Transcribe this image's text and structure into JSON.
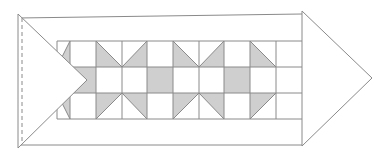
{
  "diagram": {
    "colors": {
      "background": "#ffffff",
      "line": "#8a8a8a",
      "shade": "#cfcfcf"
    },
    "outer_band": {
      "left_top": [
        18,
        18
      ],
      "right_top": [
        302,
        14
      ],
      "left_bottom": [
        18,
        145
      ],
      "right_bottom": [
        302,
        145
      ]
    },
    "inner_band": {
      "x0": 57,
      "x1": 302,
      "top": 41,
      "bottom": 119,
      "top_right": 40,
      "bottom_right": 118
    },
    "grid": {
      "columns_x": [
        57,
        70,
        96,
        122,
        147,
        173,
        199,
        224,
        250,
        276
      ],
      "rows_y": [
        41,
        67,
        93,
        119
      ]
    },
    "left_triangle": {
      "points": [
        [
          18,
          14
        ],
        [
          18,
          148
        ],
        [
          87,
          80
        ]
      ],
      "dashed_line_x": 22
    },
    "right_arrow": {
      "points": [
        [
          302,
          11
        ],
        [
          302,
          146
        ],
        [
          372,
          78
        ]
      ]
    },
    "shaded_cells": [
      {
        "col": 0,
        "row": 0,
        "type": "lower-right"
      },
      {
        "col": 0,
        "row": 2,
        "type": "upper-right"
      },
      {
        "col": 1,
        "row": 1,
        "type": "full"
      },
      {
        "col": 2,
        "row": 0,
        "type": "lower-left"
      },
      {
        "col": 2,
        "row": 2,
        "type": "upper-left"
      },
      {
        "col": 3,
        "row": 0,
        "type": "lower-right"
      },
      {
        "col": 3,
        "row": 2,
        "type": "upper-right"
      },
      {
        "col": 4,
        "row": 1,
        "type": "full"
      },
      {
        "col": 5,
        "row": 0,
        "type": "lower-left"
      },
      {
        "col": 5,
        "row": 2,
        "type": "upper-left"
      },
      {
        "col": 6,
        "row": 0,
        "type": "lower-right"
      },
      {
        "col": 6,
        "row": 2,
        "type": "upper-right"
      },
      {
        "col": 7,
        "row": 1,
        "type": "full"
      },
      {
        "col": 8,
        "row": 0,
        "type": "lower-left"
      },
      {
        "col": 8,
        "row": 2,
        "type": "upper-left"
      }
    ]
  }
}
